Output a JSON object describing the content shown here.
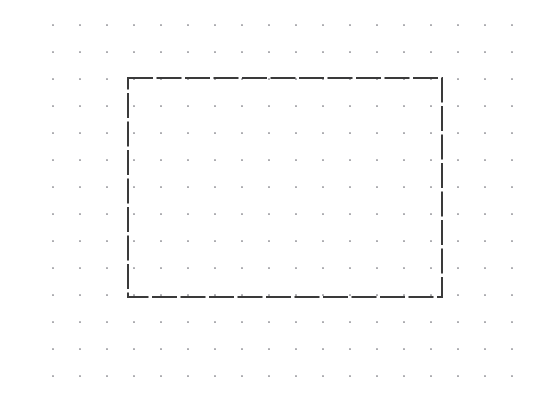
{
  "canvas": {
    "name": "dot-grid-canvas",
    "width": 560,
    "height": 402,
    "background_color": "#ffffff"
  },
  "grid": {
    "type": "dot-grid",
    "dot_color": "#6b6b73",
    "dot_radius": 0.85,
    "spacing_x": 27,
    "spacing_y": 27,
    "origin_x": 53,
    "origin_y": 25,
    "first_visible_row_y": -2,
    "columns": 18,
    "rows": 16,
    "extent_left": 53,
    "extent_right": 522,
    "extent_top": -2,
    "extent_bottom": 377,
    "visible": true
  },
  "shapes": [
    {
      "id": "rectangle-1",
      "name": "dashed-rectangle",
      "type": "rectangle",
      "x": 128,
      "y": 78,
      "width": 314,
      "height": 219,
      "right": 442,
      "bottom": 297,
      "stroke_color": "#3a3a3a",
      "stroke_width": 2,
      "stroke_style": "dashed",
      "dash_length": 25,
      "dash_gap": 3.5,
      "fill": "none",
      "corner_radius": 0,
      "selected": false
    }
  ]
}
